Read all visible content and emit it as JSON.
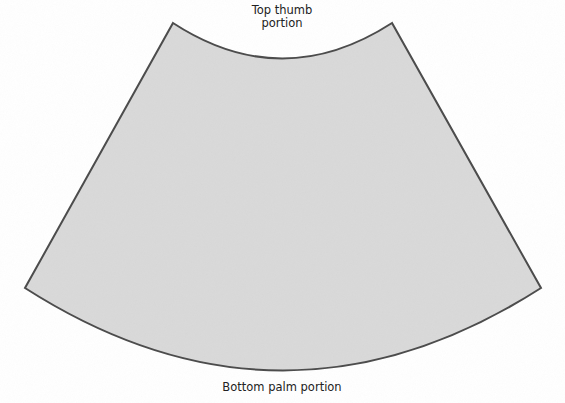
{
  "diagram": {
    "shape": "annular-sector",
    "fill_color": "#d9d9d9",
    "stroke_color": "#4a4a4a",
    "labels": {
      "top_line1": "Top thumb",
      "top_line2": "portion",
      "bottom": "Bottom palm portion"
    }
  }
}
